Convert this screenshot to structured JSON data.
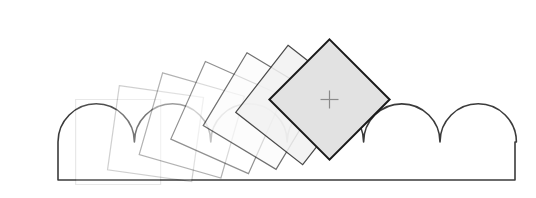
{
  "figure": {
    "title": "Rolling square on a scalloped (bumpy) surface",
    "width": 536,
    "height": 198,
    "background_color": "#ffffff"
  },
  "ground": {
    "name": "scalloped-ground",
    "left_x": 58,
    "right_x": 515,
    "baseline_y": 180,
    "valley_y": 142,
    "crest_y": 124,
    "bump_radius": 38.2,
    "bump_count": 6,
    "first_valley_x": 58,
    "fill_color": "#ffffff",
    "stroke_color": "#3b3b3b",
    "stroke_width": 1.6
  },
  "squares": {
    "side": 85,
    "count": 7,
    "stroke_base_color": "#2b2b2b",
    "fill_base_color": "#e2e2e2",
    "items": [
      {
        "label": "position-1",
        "pivot_x": 58,
        "pivot_y": 142,
        "rotation": -45,
        "opacity": 0.1,
        "fill": "#ffffff",
        "stroke": "#2b2b2b"
      },
      {
        "label": "position-2",
        "pivot_x": 96,
        "pivot_y": 142,
        "rotation": -37,
        "opacity": 0.22,
        "fill": "#ffffff",
        "stroke": "#2b2b2b"
      },
      {
        "label": "position-3",
        "pivot_x": 134,
        "pivot_y": 142,
        "rotation": -29,
        "opacity": 0.36,
        "fill": "#ffffff",
        "stroke": "#2b2b2b"
      },
      {
        "label": "position-4",
        "pivot_x": 172,
        "pivot_y": 142,
        "rotation": -21,
        "opacity": 0.52,
        "fill": "#ffffff",
        "stroke": "#2b2b2b"
      },
      {
        "label": "position-5",
        "pivot_x": 210,
        "pivot_y": 142,
        "rotation": -14,
        "opacity": 0.68,
        "fill": "#fbfbfb",
        "stroke": "#2b2b2b"
      },
      {
        "label": "position-6",
        "pivot_x": 248,
        "pivot_y": 142,
        "rotation": -7,
        "opacity": 0.85,
        "fill": "#f2f2f2",
        "stroke": "#2b2b2b"
      },
      {
        "label": "position-7",
        "pivot_x": 287,
        "pivot_y": 142,
        "rotation": 0,
        "opacity": 1.0,
        "fill": "#e2e2e2",
        "stroke": "#1a1a1a"
      }
    ]
  },
  "center_marker": {
    "name": "center-crosshair",
    "x": 287,
    "y": 80,
    "arm_length": 9,
    "color": "#8a8a8a",
    "glyph": "plus"
  }
}
